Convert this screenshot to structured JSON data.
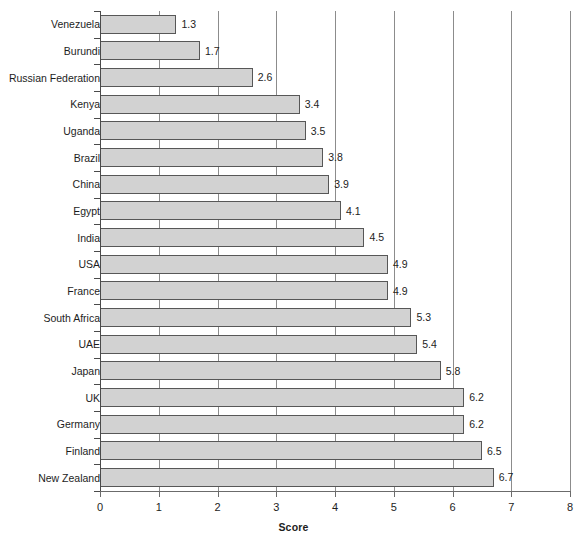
{
  "chart_data": {
    "type": "bar",
    "orientation": "horizontal",
    "title": "",
    "xlabel": "Score",
    "ylabel": "",
    "xlim": [
      0,
      8
    ],
    "xticks": [
      "0",
      "1",
      "2",
      "3",
      "4",
      "5",
      "6",
      "7",
      "8"
    ],
    "grid": true,
    "legend": "none",
    "categories": [
      "Venezuela",
      "Burundi",
      "Russian Federation",
      "Kenya",
      "Uganda",
      "Brazil",
      "China",
      "Egypt",
      "India",
      "USA",
      "France",
      "South Africa",
      "UAE",
      "Japan",
      "UK",
      "Germany",
      "Finland",
      "New Zealand"
    ],
    "values": [
      1.3,
      1.7,
      2.6,
      3.4,
      3.5,
      3.8,
      3.9,
      4.1,
      4.5,
      4.9,
      4.9,
      5.3,
      5.4,
      5.8,
      6.2,
      6.2,
      6.5,
      6.7
    ],
    "value_labels": [
      "1.3",
      "1.7",
      "2.6",
      "3.4",
      "3.5",
      "3.8",
      "3.9",
      "4.1",
      "4.5",
      "4.9",
      "4.9",
      "5.3",
      "5.4",
      "5.8",
      "6.2",
      "6.2",
      "6.5",
      "6.7"
    ],
    "bar_fill_color": "#d2d2d2",
    "bar_border_color": "#575757",
    "gridline_color": "#8c8c8c",
    "axis_color": "#4a4a4a"
  },
  "caption": {
    "text": ""
  }
}
